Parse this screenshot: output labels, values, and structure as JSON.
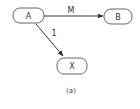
{
  "diagram": {
    "nodes": [
      {
        "id": "A",
        "label": "A"
      },
      {
        "id": "B",
        "label": "B"
      },
      {
        "id": "X",
        "label": "X"
      }
    ],
    "edges": [
      {
        "from": "A",
        "to": "B",
        "label": "M"
      },
      {
        "from": "A",
        "to": "X",
        "label": "1"
      }
    ],
    "caption": "(a)"
  }
}
